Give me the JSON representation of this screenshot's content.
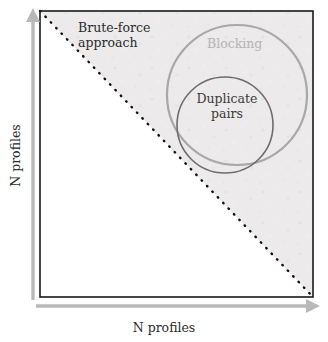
{
  "figure": {
    "type": "conceptual-diagram",
    "title_present": false,
    "background_color": "#ffffff",
    "plot_box": {
      "border_color": "#1a1a1a",
      "x": 40,
      "y": 11,
      "width": 273,
      "height": 286
    },
    "shaded_region": {
      "name": "upper-right-triangle",
      "fill_color": "#eceaea",
      "description": "full comparison space above the diagonal"
    },
    "unshaded_region": {
      "name": "lower-left-triangle",
      "fill_color": "#ffffff"
    }
  },
  "axes": {
    "x": {
      "label": "N profiles",
      "arrow_color": "#b9b9b9",
      "direction": "right"
    },
    "y": {
      "label": "N profiles",
      "arrow_color": "#b9b9b9",
      "direction": "up"
    }
  },
  "diagonal": {
    "name": "identity-diagonal",
    "style": "dotted",
    "color": "#111111",
    "from": [
      40,
      11
    ],
    "to": [
      313,
      297
    ]
  },
  "regions": [
    {
      "id": "brute-force",
      "label": "Brute-force\napproach",
      "label_line1": "Brute-force",
      "label_line2": "approach",
      "text_color": "#2b2b2b"
    },
    {
      "id": "blocking",
      "label": "Blocking",
      "shape": "circle",
      "stroke_color": "#a8a8a8",
      "text_color": "#b4b4b4",
      "center": [
        237,
        95
      ],
      "radius": 70
    },
    {
      "id": "duplicate-pairs",
      "label": "Duplicate\npairs",
      "label_line1": "Duplicate",
      "label_line2": "pairs",
      "shape": "circle",
      "stroke_color": "#6d6d6d",
      "text_color": "#3a3a3a",
      "center": [
        225,
        125
      ],
      "radius": 48
    }
  ]
}
